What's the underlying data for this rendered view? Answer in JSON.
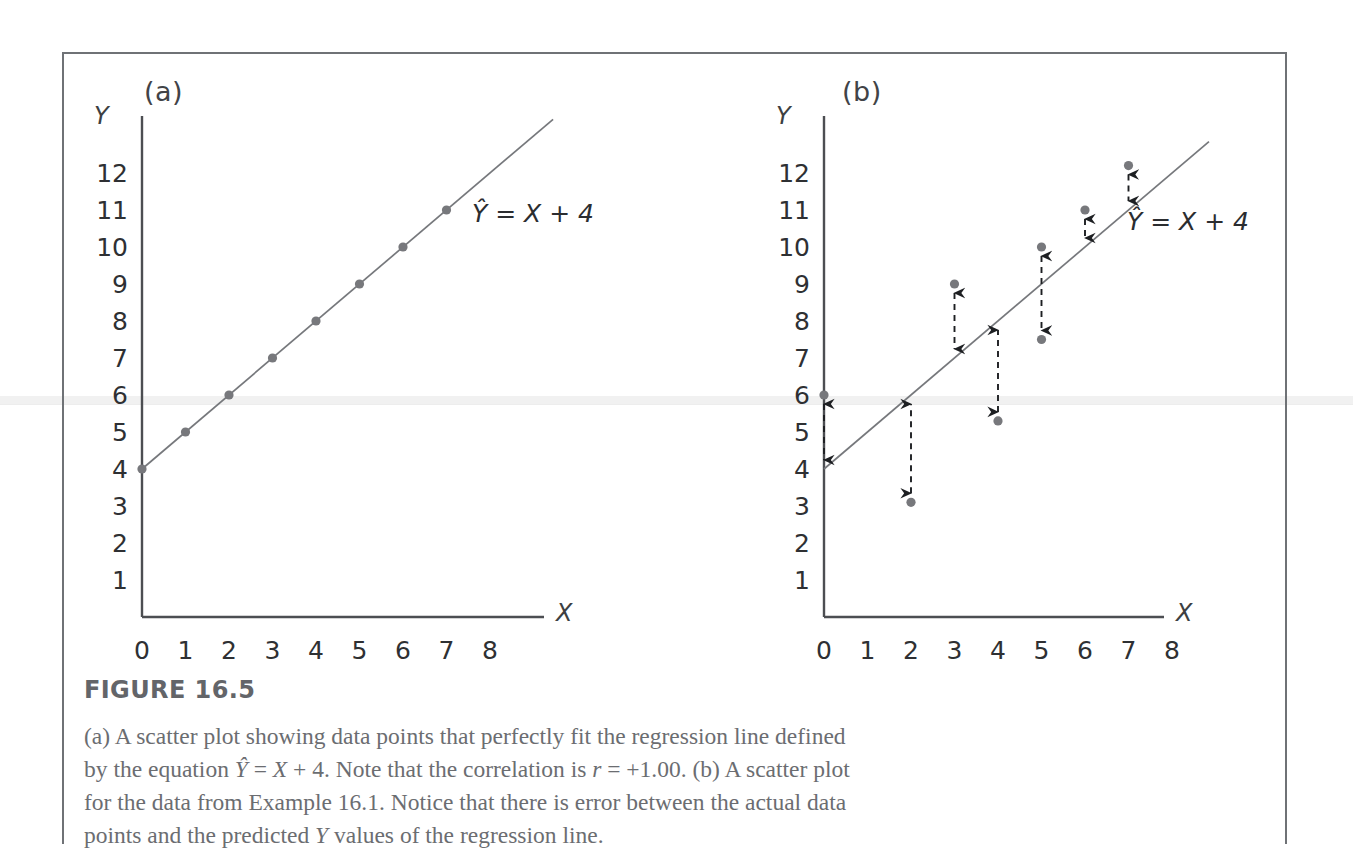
{
  "figure": {
    "heading": "FIGURE 16.5",
    "caption": "(a) A scatter plot showing data points that perfectly fit the regression line defined by the equation Ŷ = X + 4. Note that the correlation is r = +1.00. (b) A scatter plot for the data from Example 16.1. Notice that there is error between the actual data points and the predicted Y values of the regression line."
  },
  "panels": {
    "a": {
      "label": "(a)",
      "equation_label": "Ŷ = X + 4"
    },
    "b": {
      "label": "(b)",
      "equation_label": "Ŷ = X + 4"
    }
  },
  "axes": {
    "y_name": "Y",
    "x_name": "X",
    "y_ticks": [
      "1",
      "2",
      "3",
      "4",
      "5",
      "6",
      "7",
      "8",
      "9",
      "10",
      "11",
      "12"
    ],
    "x_ticks": [
      "0",
      "1",
      "2",
      "3",
      "4",
      "5",
      "6",
      "7",
      "8"
    ]
  },
  "colors": {
    "point": "#77787c",
    "line": "#76787c",
    "arrow": "#1d1f22",
    "axis": "#4c4e52",
    "frame": "#6f7276",
    "caption_text": "#6b6d71",
    "heading_text": "#636569"
  },
  "chart_data": [
    {
      "type": "scatter",
      "title": "(a)",
      "xlabel": "X",
      "ylabel": "Y",
      "xlim": [
        0,
        8.6
      ],
      "ylim": [
        0,
        12.8
      ],
      "grid": false,
      "legend": "none",
      "annotations": [
        "Ŷ = X + 4"
      ],
      "regression_line": {
        "equation": "Ŷ = X + 4",
        "slope": 1,
        "intercept": 4
      },
      "correlation": "+1.00",
      "x": [
        0,
        1,
        2,
        3,
        4,
        5,
        6,
        7
      ],
      "y": [
        4,
        5,
        6,
        7,
        8,
        9,
        10,
        11
      ],
      "points": [
        {
          "x": 0,
          "y": 4
        },
        {
          "x": 1,
          "y": 5
        },
        {
          "x": 2,
          "y": 6
        },
        {
          "x": 3,
          "y": 7
        },
        {
          "x": 4,
          "y": 8
        },
        {
          "x": 5,
          "y": 9
        },
        {
          "x": 6,
          "y": 10
        },
        {
          "x": 7,
          "y": 11
        }
      ]
    },
    {
      "type": "scatter",
      "title": "(b)",
      "xlabel": "X",
      "ylabel": "Y",
      "xlim": [
        0,
        8.6
      ],
      "ylim": [
        0,
        12.8
      ],
      "grid": false,
      "legend": "none",
      "annotations": [
        "Ŷ = X + 4"
      ],
      "regression_line": {
        "equation": "Ŷ = X + 4",
        "slope": 1,
        "intercept": 4
      },
      "x": [
        0,
        2,
        3,
        4,
        5,
        5,
        6,
        7
      ],
      "y": [
        6,
        3.1,
        9,
        5.3,
        10,
        7.5,
        11,
        12.2
      ],
      "points": [
        {
          "x": 0,
          "y": 6,
          "predicted": 4,
          "error": 2.0
        },
        {
          "x": 2,
          "y": 3.1,
          "predicted": 6,
          "error": -2.9
        },
        {
          "x": 3,
          "y": 9,
          "predicted": 7,
          "error": 2.0
        },
        {
          "x": 4,
          "y": 5.3,
          "predicted": 8,
          "error": -2.7
        },
        {
          "x": 5,
          "y": 10,
          "predicted": 9,
          "error": 1.0
        },
        {
          "x": 5,
          "y": 7.5,
          "predicted": 9,
          "error": -1.5
        },
        {
          "x": 6,
          "y": 11,
          "predicted": 10,
          "error": 1.0
        },
        {
          "x": 7,
          "y": 12.2,
          "predicted": 11,
          "error": 1.2
        }
      ],
      "error_bars": [
        {
          "x": 0,
          "from": 6,
          "to": 4
        },
        {
          "x": 2,
          "from": 3.1,
          "to": 6
        },
        {
          "x": 3,
          "from": 9,
          "to": 7
        },
        {
          "x": 4,
          "from": 5.3,
          "to": 8
        },
        {
          "x": 5,
          "from": 10,
          "to": 7.5
        },
        {
          "x": 6,
          "from": 11,
          "to": 10
        },
        {
          "x": 7,
          "from": 12.2,
          "to": 11
        }
      ]
    }
  ]
}
